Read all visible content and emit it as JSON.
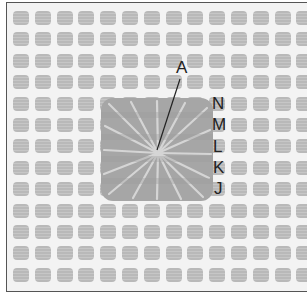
{
  "diagram": {
    "grid": {
      "columns": 14,
      "rows": 13,
      "cell_color": "#b9b9b9",
      "background": "#f3f3f3",
      "border_color": "#555555"
    },
    "stitch": {
      "type": "radiating-star",
      "color": "#a6a6a6",
      "highlight": "#dedede"
    },
    "pointer_label": "A",
    "row_labels": [
      "N",
      "M",
      "L",
      "K",
      "J"
    ]
  }
}
